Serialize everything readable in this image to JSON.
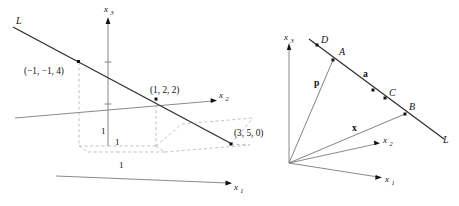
{
  "figure": {
    "kind": "two-panel-3d-vector-geometry-diagram",
    "background_color": "#ffffff",
    "line_color": "#2a2a2a",
    "axis_color": "#6b6b6b",
    "dashed_color": "#a8a8a8",
    "dot_color": "#111111"
  },
  "left_panel": {
    "name": "line-through-points-in-R3",
    "axes": [
      {
        "id": "x3",
        "label": "x",
        "subscript": "3"
      },
      {
        "id": "x2",
        "label": "x",
        "subscript": "2"
      },
      {
        "id": "x1",
        "label": "x",
        "subscript": "1"
      }
    ],
    "line_label": "L",
    "tick_labels": [
      "1",
      "1",
      "1"
    ],
    "points": [
      {
        "id": "p1",
        "label": "(−1, −1, 4)"
      },
      {
        "id": "p2",
        "label": "(1, 2, 2)"
      },
      {
        "id": "p3",
        "label": "(3, 5, 0)"
      }
    ]
  },
  "right_panel": {
    "name": "vectors-to-line-L",
    "axes": [
      {
        "id": "x3",
        "label": "x",
        "subscript": "3"
      },
      {
        "id": "x2",
        "label": "x",
        "subscript": "2"
      },
      {
        "id": "x1",
        "label": "x",
        "subscript": "1"
      }
    ],
    "line_label": "L",
    "points": [
      {
        "id": "D",
        "label": "D"
      },
      {
        "id": "A",
        "label": "A"
      },
      {
        "id": "C",
        "label": "C"
      },
      {
        "id": "B",
        "label": "B"
      }
    ],
    "vectors": [
      {
        "id": "p",
        "label": "p"
      },
      {
        "id": "a",
        "label": "a"
      },
      {
        "id": "x",
        "label": "x"
      }
    ]
  }
}
